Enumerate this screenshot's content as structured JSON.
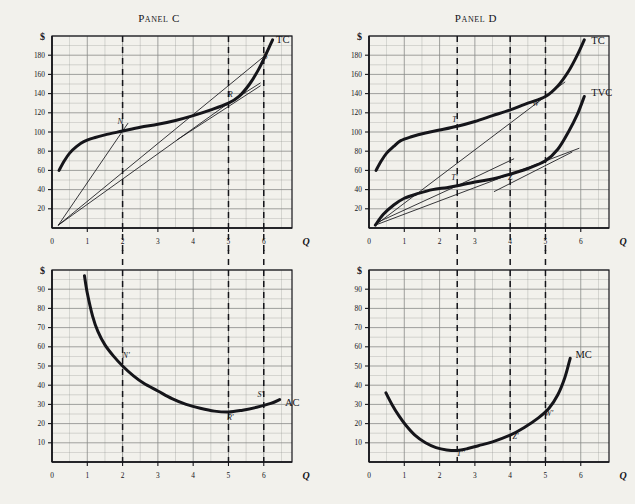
{
  "figure": {
    "background": "#f2f1ec",
    "ink": "#15151a",
    "grid_color": "#8b8d8a",
    "axis_label_x": "Q",
    "axis_label_y": "$"
  },
  "panels": [
    {
      "id": "panel-c",
      "title": "Panel C",
      "y_ticks": [
        20,
        40,
        60,
        80,
        100,
        120,
        140,
        160,
        180
      ],
      "x_ticks": [
        0,
        1,
        2,
        3,
        4,
        5,
        6
      ],
      "dashed_verticals": [
        2,
        5,
        6
      ],
      "curve_labels": [
        {
          "text": "TC",
          "q": 6.35,
          "v": 193
        }
      ],
      "point_labels": [
        {
          "text": "N",
          "q": 1.93,
          "v": 108
        },
        {
          "text": "R",
          "q": 5.05,
          "v": 136
        },
        {
          "text": "S",
          "q": 6.05,
          "v": 176
        }
      ]
    },
    {
      "id": "panel-d",
      "title": "Panel D",
      "y_ticks": [
        20,
        40,
        60,
        80,
        100,
        120,
        140,
        160,
        180
      ],
      "x_ticks": [
        0,
        1,
        2,
        3,
        4,
        5,
        6
      ],
      "dashed_verticals": [
        2.5,
        4,
        5
      ],
      "curve_labels": [
        {
          "text": "TC",
          "q": 6.3,
          "v": 192
        },
        {
          "text": "TVC",
          "q": 6.3,
          "v": 137
        }
      ],
      "point_labels": [
        {
          "text": "T",
          "q": 2.42,
          "v": 110
        },
        {
          "text": "T'",
          "q": 2.42,
          "v": 50
        },
        {
          "text": "W",
          "q": 4.72,
          "v": 127
        },
        {
          "text": "Z",
          "q": 4.0,
          "v": 50
        }
      ]
    },
    {
      "id": "panel-ac",
      "title": "",
      "y_ticks": [
        10,
        20,
        30,
        40,
        50,
        60,
        70,
        80,
        90
      ],
      "x_ticks": [
        0,
        1,
        2,
        3,
        4,
        5,
        6
      ],
      "dashed_verticals": [
        2,
        5,
        6
      ],
      "curve_labels": [
        {
          "text": "AC",
          "q": 6.6,
          "v": 29
        }
      ],
      "point_labels": [
        {
          "text": "N'",
          "q": 2.1,
          "v": 54
        },
        {
          "text": "R'",
          "q": 5.05,
          "v": 22
        },
        {
          "text": "S'",
          "q": 5.9,
          "v": 34
        }
      ]
    },
    {
      "id": "panel-mc",
      "title": "",
      "y_ticks": [
        10,
        20,
        30,
        40,
        50,
        60,
        70,
        80,
        90
      ],
      "x_ticks": [
        0,
        1,
        2,
        3,
        4,
        5,
        6
      ],
      "dashed_verticals": [
        2.5,
        4,
        5
      ],
      "curve_labels": [
        {
          "text": "MC",
          "q": 5.85,
          "v": 54
        }
      ],
      "point_labels": [
        {
          "text": "T''",
          "q": 2.6,
          "v": 3
        },
        {
          "text": "Z'",
          "q": 4.15,
          "v": 12
        },
        {
          "text": "W'",
          "q": 5.1,
          "v": 24
        }
      ]
    }
  ],
  "chart_data": [
    {
      "type": "line",
      "id": "panel-c",
      "title": "Panel C",
      "xlabel": "Q",
      "ylabel": "$",
      "xlim": [
        0,
        6.8
      ],
      "ylim": [
        0,
        200
      ],
      "grid": true,
      "series": [
        {
          "name": "TC",
          "points": [
            [
              0.2,
              60
            ],
            [
              0.35,
              70
            ],
            [
              0.5,
              78
            ],
            [
              0.7,
              85
            ],
            [
              0.9,
              90
            ],
            [
              1.2,
              94
            ],
            [
              1.5,
              97
            ],
            [
              2.0,
              101
            ],
            [
              2.5,
              105
            ],
            [
              3.0,
              108
            ],
            [
              3.5,
              112
            ],
            [
              4.0,
              117
            ],
            [
              4.5,
              123
            ],
            [
              5.0,
              130
            ],
            [
              5.3,
              137
            ],
            [
              5.6,
              150
            ],
            [
              5.85,
              165
            ],
            [
              6.05,
              180
            ],
            [
              6.25,
              196
            ]
          ]
        },
        {
          "name": "ray-to-N",
          "kind": "ray",
          "points": [
            [
              0.18,
              3
            ],
            [
              2.0,
              101
            ],
            [
              2.15,
              109
            ]
          ]
        },
        {
          "name": "ray-to-S",
          "kind": "ray",
          "points": [
            [
              0.18,
              3
            ],
            [
              6.05,
              180
            ]
          ]
        },
        {
          "name": "ray-to-R",
          "kind": "ray",
          "points": [
            [
              0.18,
              3
            ],
            [
              5.0,
              130
            ],
            [
              5.9,
              151
            ]
          ]
        },
        {
          "name": "tangent-at-R",
          "kind": "tangent",
          "points": [
            [
              3.55,
              92
            ],
            [
              5.9,
              148
            ]
          ]
        }
      ],
      "annotations": [
        {
          "label": "N",
          "q": 2.0,
          "v": 101
        },
        {
          "label": "R",
          "q": 5.0,
          "v": 130
        },
        {
          "label": "S",
          "q": 6.05,
          "v": 180
        },
        {
          "label": "TC",
          "q": 6.35,
          "v": 193
        }
      ]
    },
    {
      "type": "line",
      "id": "panel-d",
      "title": "Panel D",
      "xlabel": "Q",
      "ylabel": "$",
      "xlim": [
        0,
        6.8
      ],
      "ylim": [
        0,
        200
      ],
      "grid": true,
      "series": [
        {
          "name": "TC",
          "points": [
            [
              0.2,
              60
            ],
            [
              0.35,
              70
            ],
            [
              0.5,
              78
            ],
            [
              0.7,
              85
            ],
            [
              0.9,
              91
            ],
            [
              1.2,
              95
            ],
            [
              1.6,
              99
            ],
            [
              2.0,
              102
            ],
            [
              2.5,
              106
            ],
            [
              3.0,
              111
            ],
            [
              3.5,
              117
            ],
            [
              4.0,
              123
            ],
            [
              4.5,
              130
            ],
            [
              5.0,
              137
            ],
            [
              5.35,
              148
            ],
            [
              5.65,
              163
            ],
            [
              5.9,
              180
            ],
            [
              6.1,
              196
            ]
          ]
        },
        {
          "name": "TVC",
          "points": [
            [
              0.18,
              3
            ],
            [
              0.4,
              14
            ],
            [
              0.7,
              24
            ],
            [
              1.0,
              31
            ],
            [
              1.4,
              36
            ],
            [
              1.8,
              40
            ],
            [
              2.2,
              42
            ],
            [
              2.5,
              44
            ],
            [
              3.0,
              48
            ],
            [
              3.5,
              51
            ],
            [
              4.0,
              56
            ],
            [
              4.5,
              62
            ],
            [
              5.0,
              70
            ],
            [
              5.35,
              82
            ],
            [
              5.65,
              100
            ],
            [
              5.9,
              118
            ],
            [
              6.1,
              137
            ]
          ]
        },
        {
          "name": "ray-to-W",
          "kind": "ray",
          "points": [
            [
              0.18,
              3
            ],
            [
              5.0,
              137
            ],
            [
              5.55,
              152
            ]
          ]
        },
        {
          "name": "ray-to-Z",
          "kind": "ray",
          "points": [
            [
              0.18,
              3
            ],
            [
              4.0,
              56
            ],
            [
              5.95,
              83
            ]
          ]
        },
        {
          "name": "tangent-at-T",
          "kind": "tangent",
          "points": [
            [
              0.25,
              6
            ],
            [
              2.5,
              44
            ],
            [
              4.1,
              72
            ]
          ]
        },
        {
          "name": "tangent-at-Z",
          "kind": "tangent",
          "points": [
            [
              3.55,
              38
            ],
            [
              5.75,
              79
            ]
          ]
        }
      ],
      "annotations": [
        {
          "label": "T",
          "q": 2.5,
          "v": 106
        },
        {
          "label": "T'",
          "q": 2.5,
          "v": 44
        },
        {
          "label": "W",
          "q": 5.0,
          "v": 137
        },
        {
          "label": "Z",
          "q": 4.0,
          "v": 56
        },
        {
          "label": "TC",
          "q": 6.3,
          "v": 192
        },
        {
          "label": "TVC",
          "q": 6.3,
          "v": 137
        }
      ]
    },
    {
      "type": "line",
      "id": "panel-ac",
      "title": "",
      "xlabel": "Q",
      "ylabel": "$",
      "xlim": [
        0,
        6.8
      ],
      "ylim": [
        0,
        100
      ],
      "grid": true,
      "series": [
        {
          "name": "AC",
          "points": [
            [
              0.92,
              97
            ],
            [
              1.0,
              88
            ],
            [
              1.15,
              76
            ],
            [
              1.3,
              68
            ],
            [
              1.5,
              61
            ],
            [
              1.75,
              55
            ],
            [
              2.0,
              50
            ],
            [
              2.3,
              45
            ],
            [
              2.6,
              41
            ],
            [
              3.0,
              37
            ],
            [
              3.4,
              33
            ],
            [
              3.8,
              30
            ],
            [
              4.2,
              28
            ],
            [
              4.6,
              26.5
            ],
            [
              5.0,
              26
            ],
            [
              5.4,
              27
            ],
            [
              5.8,
              28.5
            ],
            [
              6.2,
              30.5
            ],
            [
              6.45,
              32.5
            ]
          ]
        }
      ],
      "annotations": [
        {
          "label": "N'",
          "q": 2.0,
          "v": 50
        },
        {
          "label": "R'",
          "q": 5.0,
          "v": 26
        },
        {
          "label": "S'",
          "q": 6.0,
          "v": 29.5
        },
        {
          "label": "AC",
          "q": 6.6,
          "v": 29
        }
      ]
    },
    {
      "type": "line",
      "id": "panel-mc",
      "title": "",
      "xlabel": "Q",
      "ylabel": "$",
      "xlim": [
        0,
        6.8
      ],
      "ylim": [
        0,
        100
      ],
      "grid": true,
      "series": [
        {
          "name": "MC",
          "points": [
            [
              0.48,
              36
            ],
            [
              0.65,
              30
            ],
            [
              0.85,
              24
            ],
            [
              1.05,
              19
            ],
            [
              1.3,
              14
            ],
            [
              1.6,
              10
            ],
            [
              1.9,
              7.5
            ],
            [
              2.2,
              6.3
            ],
            [
              2.5,
              6
            ],
            [
              2.8,
              7
            ],
            [
              3.1,
              8.5
            ],
            [
              3.5,
              10.5
            ],
            [
              4.0,
              14
            ],
            [
              4.4,
              18
            ],
            [
              4.8,
              23
            ],
            [
              5.1,
              28
            ],
            [
              5.35,
              35
            ],
            [
              5.55,
              44
            ],
            [
              5.7,
              54
            ]
          ]
        }
      ],
      "annotations": [
        {
          "label": "T''",
          "q": 2.5,
          "v": 6
        },
        {
          "label": "Z'",
          "q": 4.0,
          "v": 14
        },
        {
          "label": "W'",
          "q": 5.0,
          "v": 26
        },
        {
          "label": "MC",
          "q": 5.85,
          "v": 54
        }
      ]
    }
  ]
}
